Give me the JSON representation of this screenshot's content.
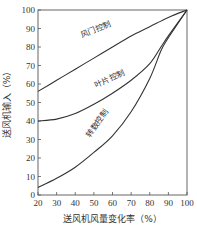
{
  "chart_data": {
    "type": "line",
    "title": "",
    "xlabel": "送风机风量变化率（%）",
    "ylabel": "送风机输入（%）",
    "xlim": [
      20,
      100
    ],
    "ylim": [
      0,
      100
    ],
    "xticks": [
      20,
      30,
      40,
      50,
      60,
      70,
      80,
      90,
      100
    ],
    "yticks": [
      0,
      10,
      20,
      30,
      40,
      50,
      60,
      70,
      80,
      90,
      100
    ],
    "grid": false,
    "legend": "inline curve labels",
    "series": [
      {
        "name": "风门控制",
        "x": [
          20,
          30,
          40,
          50,
          60,
          70,
          80,
          90,
          100
        ],
        "y": [
          56,
          62,
          68,
          74,
          80,
          86,
          91,
          96,
          100
        ]
      },
      {
        "name": "叶片控制",
        "x": [
          20,
          30,
          40,
          50,
          60,
          70,
          80,
          86,
          90,
          100
        ],
        "y": [
          40,
          41,
          44,
          49,
          55,
          62,
          71,
          80,
          86,
          100
        ]
      },
      {
        "name": "转数控制",
        "x": [
          20,
          30,
          40,
          50,
          60,
          70,
          80,
          86,
          90,
          100
        ],
        "y": [
          4,
          9,
          15,
          23,
          32,
          45,
          63,
          78,
          85,
          100
        ]
      }
    ]
  },
  "plot": {
    "left": 38,
    "right": 187,
    "top": 10,
    "bottom": 195,
    "line_color": "#333333",
    "frame_color": "#555555"
  },
  "labels": {
    "damper": {
      "text": "风门控制",
      "x": 82,
      "y": 38,
      "angle": -23
    },
    "vane": {
      "text": "叶片控制",
      "x": 96,
      "y": 88,
      "angle": -25
    },
    "speed": {
      "text": "转数控制",
      "x": 90,
      "y": 138,
      "angle": -55
    }
  }
}
